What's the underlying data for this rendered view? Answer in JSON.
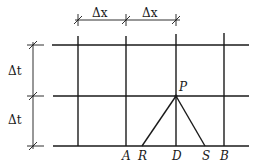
{
  "figure": {
    "dimensions": {
      "dx_label_1": "Δx",
      "dx_label_2": "Δx",
      "dt_label_1": "Δt",
      "dt_label_2": "Δt"
    },
    "points": {
      "P": "P",
      "A": "A",
      "R": "R",
      "D": "D",
      "S": "S",
      "B": "B"
    },
    "grid": {
      "vertical_lines_x": [
        78,
        126,
        176,
        224
      ],
      "horizontal_lines_y": [
        45,
        96,
        146
      ]
    }
  }
}
